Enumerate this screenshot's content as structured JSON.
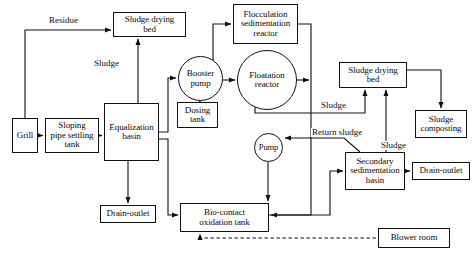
{
  "diagram": {
    "type": "process-flow",
    "stroke_color": "#101010",
    "background_color": "#ffffff",
    "nodes": [
      {
        "id": "grill",
        "label": "Grill",
        "shape": "rect",
        "x": 12,
        "y": 118,
        "w": 26,
        "h": 35
      },
      {
        "id": "sloping-pipe-settling-tank",
        "label": "Sloping\npipe settling\ntank",
        "shape": "rect",
        "x": 45,
        "y": 118,
        "w": 54,
        "h": 35
      },
      {
        "id": "equalization-basin",
        "label": "Equalization\nbasin",
        "shape": "rect",
        "x": 104,
        "y": 103,
        "w": 55,
        "h": 58
      },
      {
        "id": "sludge-drying-bed-left",
        "label": "Sludge drying\nbed",
        "shape": "rect",
        "x": 113,
        "y": 12,
        "w": 73,
        "h": 25
      },
      {
        "id": "booster-pump",
        "label": "Booster\npump",
        "shape": "circle",
        "x": 178,
        "y": 56,
        "w": 45,
        "h": 45
      },
      {
        "id": "dosing-tank",
        "label": "Dosing\ntank",
        "shape": "rect",
        "x": 177,
        "y": 102,
        "w": 41,
        "h": 26
      },
      {
        "id": "flocculation-sedimentation-reactor",
        "label": "Flocculation\nsedimentation\nreactor",
        "shape": "rect",
        "x": 233,
        "y": 4,
        "w": 65,
        "h": 40
      },
      {
        "id": "floatation-reactor",
        "label": "Floatation\nreactor",
        "shape": "circle",
        "x": 237,
        "y": 50,
        "w": 60,
        "h": 60
      },
      {
        "id": "sludge-drying-bed-right",
        "label": "Sludge drying\nbed",
        "shape": "rect",
        "x": 339,
        "y": 62,
        "w": 68,
        "h": 26
      },
      {
        "id": "sludge-composting",
        "label": "Sludge\ncomposting",
        "shape": "rect",
        "x": 415,
        "y": 110,
        "w": 52,
        "h": 28
      },
      {
        "id": "pump",
        "label": "Pump",
        "shape": "circle",
        "x": 254,
        "y": 133,
        "w": 29,
        "h": 29
      },
      {
        "id": "secondary-sedimentation-basin",
        "label": "Secondary\nsedimentation\nbasin",
        "shape": "rect",
        "x": 345,
        "y": 152,
        "w": 60,
        "h": 38
      },
      {
        "id": "drain-outlet-right",
        "label": "Drain-outlet",
        "shape": "rect",
        "x": 412,
        "y": 162,
        "w": 58,
        "h": 18
      },
      {
        "id": "drain-outlet-left",
        "label": "Drain-outlet",
        "shape": "rect",
        "x": 100,
        "y": 205,
        "w": 56,
        "h": 18
      },
      {
        "id": "bio-contact-oxidation-tank",
        "label": "Bio-contact\noxidation tank",
        "shape": "rect",
        "x": 180,
        "y": 203,
        "w": 89,
        "h": 29
      },
      {
        "id": "blower-room",
        "label": "Blower room",
        "shape": "rect",
        "x": 378,
        "y": 228,
        "w": 72,
        "h": 20
      }
    ],
    "edge_labels": [
      {
        "id": "residue",
        "text": "Residue",
        "x": 48,
        "y": 16
      },
      {
        "id": "sludge-left",
        "text": "Sludge",
        "x": 93,
        "y": 59
      },
      {
        "id": "sludge-mid",
        "text": "Sludge",
        "x": 320,
        "y": 101
      },
      {
        "id": "return-sludge",
        "text": "Return sludge",
        "x": 311,
        "y": 128
      },
      {
        "id": "sludge-right",
        "text": "Sludge",
        "x": 380,
        "y": 141
      }
    ],
    "connections": [
      {
        "from": "grill",
        "to": "sloping-pipe-settling-tank",
        "label": ""
      },
      {
        "from": "sloping-pipe-settling-tank",
        "to": "equalization-basin",
        "label": ""
      },
      {
        "from": "sloping-pipe-settling-tank",
        "to": "sludge-drying-bed-left",
        "label": "Residue"
      },
      {
        "from": "equalization-basin",
        "to": "sludge-drying-bed-left",
        "label": "Sludge"
      },
      {
        "from": "equalization-basin",
        "to": "drain-outlet-left",
        "label": ""
      },
      {
        "from": "equalization-basin",
        "to": "booster-pump",
        "label": ""
      },
      {
        "from": "equalization-basin",
        "to": "bio-contact-oxidation-tank",
        "label": ""
      },
      {
        "from": "booster-pump",
        "to": "dosing-tank",
        "label": ""
      },
      {
        "from": "booster-pump",
        "to": "floatation-reactor",
        "label": ""
      },
      {
        "from": "booster-pump",
        "to": "flocculation-sedimentation-reactor",
        "label": ""
      },
      {
        "from": "flocculation-sedimentation-reactor",
        "to": "bio-contact-oxidation-tank",
        "label": ""
      },
      {
        "from": "floatation-reactor",
        "to": "bio-contact-oxidation-tank",
        "label": ""
      },
      {
        "from": "floatation-reactor",
        "to": "sludge-drying-bed-right",
        "label": "Sludge"
      },
      {
        "from": "sludge-drying-bed-right",
        "to": "sludge-composting",
        "label": ""
      },
      {
        "from": "secondary-sedimentation-basin",
        "to": "sludge-drying-bed-right",
        "label": "Sludge"
      },
      {
        "from": "secondary-sedimentation-basin",
        "to": "pump",
        "label": "Return sludge"
      },
      {
        "from": "secondary-sedimentation-basin",
        "to": "drain-outlet-right",
        "label": ""
      },
      {
        "from": "pump",
        "to": "bio-contact-oxidation-tank",
        "label": ""
      },
      {
        "from": "bio-contact-oxidation-tank",
        "to": "secondary-sedimentation-basin",
        "label": ""
      },
      {
        "from": "blower-room",
        "to": "bio-contact-oxidation-tank",
        "label": "",
        "style": "dashed"
      }
    ]
  }
}
